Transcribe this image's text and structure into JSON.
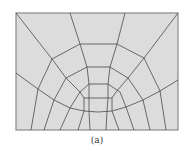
{
  "figure": {
    "caption": "(a)",
    "colors": {
      "fill": "#dcdcdc",
      "line": "#4a4a4a",
      "frame": "#8a8a8a"
    }
  },
  "mesh": {
    "frame": {
      "x": 16,
      "y": 13,
      "w": 162,
      "h": 117
    },
    "polylines": [
      [
        [
          16,
          13
        ],
        [
          52,
          59
        ],
        [
          66,
          78
        ],
        [
          80,
          92
        ],
        [
          84,
          98
        ]
      ],
      [
        [
          178,
          13
        ],
        [
          144,
          58
        ],
        [
          128,
          78
        ],
        [
          116,
          92
        ],
        [
          112,
          98
        ]
      ],
      [
        [
          70,
          13
        ],
        [
          80,
          44
        ],
        [
          87,
          67
        ],
        [
          89,
          84
        ],
        [
          89,
          98
        ]
      ],
      [
        [
          125,
          13
        ],
        [
          117,
          44
        ],
        [
          110,
          67
        ],
        [
          108,
          84
        ],
        [
          108,
          98
        ]
      ],
      [
        [
          52,
          59
        ],
        [
          80,
          44
        ],
        [
          117,
          44
        ],
        [
          144,
          58
        ]
      ],
      [
        [
          66,
          78
        ],
        [
          87,
          67
        ],
        [
          110,
          67
        ],
        [
          128,
          78
        ]
      ],
      [
        [
          80,
          92
        ],
        [
          89,
          84
        ],
        [
          108,
          84
        ],
        [
          120,
          92
        ]
      ],
      [
        [
          84,
          98
        ],
        [
          89,
          98
        ],
        [
          108,
          98
        ],
        [
          112,
          98
        ]
      ],
      [
        [
          16,
          73
        ],
        [
          38,
          89
        ],
        [
          54,
          100
        ],
        [
          70,
          108
        ],
        [
          84,
          111
        ],
        [
          98,
          112
        ],
        [
          112,
          111
        ],
        [
          126,
          107
        ],
        [
          143,
          100
        ],
        [
          160,
          91
        ],
        [
          178,
          80
        ]
      ],
      [
        [
          52,
          59
        ],
        [
          38,
          89
        ],
        [
          31,
          130
        ]
      ],
      [
        [
          66,
          78
        ],
        [
          54,
          100
        ],
        [
          44,
          130
        ]
      ],
      [
        [
          80,
          92
        ],
        [
          70,
          108
        ],
        [
          60,
          130
        ]
      ],
      [
        [
          84,
          98
        ],
        [
          84,
          111
        ],
        [
          78,
          130
        ]
      ],
      [
        [
          89,
          98
        ],
        [
          89,
          111
        ],
        [
          90,
          130
        ]
      ],
      [
        [
          108,
          98
        ],
        [
          107,
          111
        ],
        [
          106,
          130
        ]
      ],
      [
        [
          112,
          98
        ],
        [
          112,
          111
        ],
        [
          119,
          130
        ]
      ],
      [
        [
          120,
          92
        ],
        [
          126,
          107
        ],
        [
          134,
          130
        ]
      ],
      [
        [
          128,
          78
        ],
        [
          143,
          100
        ],
        [
          150,
          130
        ]
      ],
      [
        [
          144,
          58
        ],
        [
          160,
          91
        ],
        [
          166,
          130
        ]
      ]
    ]
  }
}
